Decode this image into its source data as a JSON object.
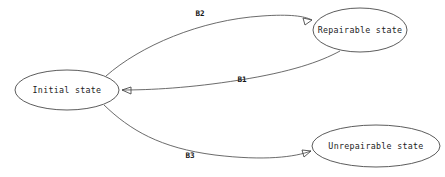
{
  "diagram": {
    "type": "state-transition-diagram",
    "background_color": "#ffffff",
    "node_stroke_color": "#4a4a4a",
    "edge_stroke_color": "#5a5a5a",
    "text_color": "#1c1c1c",
    "nodes": [
      {
        "id": "initial",
        "label": "Initial state",
        "cx": 67,
        "cy": 90,
        "rx": 52,
        "ry": 20
      },
      {
        "id": "repairable",
        "label": "Repairable state",
        "cx": 360,
        "cy": 30,
        "rx": 47,
        "ry": 22
      },
      {
        "id": "unrepairable",
        "label": "Unrepairable state",
        "cx": 376,
        "cy": 146,
        "rx": 64,
        "ry": 21
      }
    ],
    "edges": [
      {
        "id": "edge-b2",
        "label": "B2",
        "from": "initial",
        "to": "repairable",
        "label_x": 200,
        "label_y": 14,
        "path": "M 106,76 C 140,46 200,20 262,16 C 290,14 304,16 312,20",
        "arrow": "M 312,20 L 303,18 L 305,25 Z"
      },
      {
        "id": "edge-b1",
        "label": "B1",
        "from": "repairable",
        "to": "initial",
        "label_x": 242,
        "label_y": 80,
        "path": "M 340,51 C 320,62 290,72 240,80 C 190,88 150,90 122,90",
        "arrow": "M 122,90 L 131,87 L 131,94 Z"
      },
      {
        "id": "edge-b3",
        "label": "B3",
        "from": "initial",
        "to": "unrepairable",
        "label_x": 190,
        "label_y": 156,
        "path": "M 104,105 C 130,130 160,148 215,155 C 265,161 295,157 311,151",
        "arrow": "M 311,151 L 302,150 L 304,157 Z"
      }
    ]
  }
}
